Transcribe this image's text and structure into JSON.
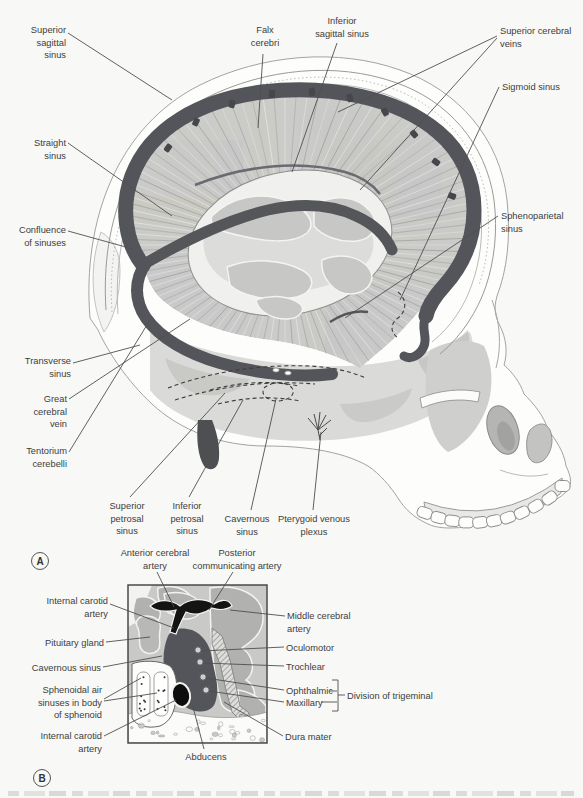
{
  "figure": {
    "panelA": {
      "tag": "A",
      "labels": {
        "superior_sagittal_sinus": "Superior\nsagittal\nsinus",
        "falx_cerebri": "Falx\ncerebri",
        "inferior_sagittal_sinus": "Inferior\nsagittal sinus",
        "superior_cerebral_veins": "Superior cerebral\nveins",
        "sigmoid_sinus": "Sigmoid sinus",
        "straight_sinus": "Straight\nsinus",
        "sphenoparietal_sinus": "Sphenoparietal\nsinus",
        "confluence_of_sinuses": "Confluence\nof sinuses",
        "transverse_sinus": "Transverse\nsinus",
        "great_cerebral_vein": "Great\ncerebral\nvein",
        "tentorium_cerebelli": "Tentorium\ncerebelli",
        "superior_petrosal_sinus": "Superior\npetrosal\nsinus",
        "inferior_petrosal_sinus": "Inferior\npetrosal\nsinus",
        "cavernous_sinus": "Cavernous\nsinus",
        "pterygoid_venous_plexus": "Pterygoid venous\nplexus"
      }
    },
    "panelB": {
      "tag": "B",
      "labels": {
        "anterior_cerebral_artery": "Anterior cerebral\nartery",
        "posterior_communicating_artery": "Posterior\ncommunicating artery",
        "internal_carotid_artery_upper": "Internal carotid\nartery",
        "pituitary_gland": "Pituitary gland",
        "cavernous_sinus": "Cavernous sinus",
        "sphenoidal_air_sinuses": "Sphenoidal air\nsinuses in body\nof sphenoid",
        "internal_carotid_artery_lower": "Internal carotid\nartery",
        "abducens": "Abducens",
        "middle_cerebral_artery": "Middle cerebral\nartery",
        "oculomotor": "Oculomotor",
        "trochlear": "Trochlear",
        "ophthalmic": "Ophthalmic",
        "maxillary": "Maxillary",
        "dura_mater": "Dura mater",
        "division_of_trigeminal": "Division of trigeminal"
      }
    },
    "colors": {
      "sinus_dark": "#55565a",
      "artery_black": "#141414",
      "brain_gray": "#c9c9c7",
      "bone_white": "#fdfdfc",
      "leader_line": "#4f4f4f"
    }
  }
}
